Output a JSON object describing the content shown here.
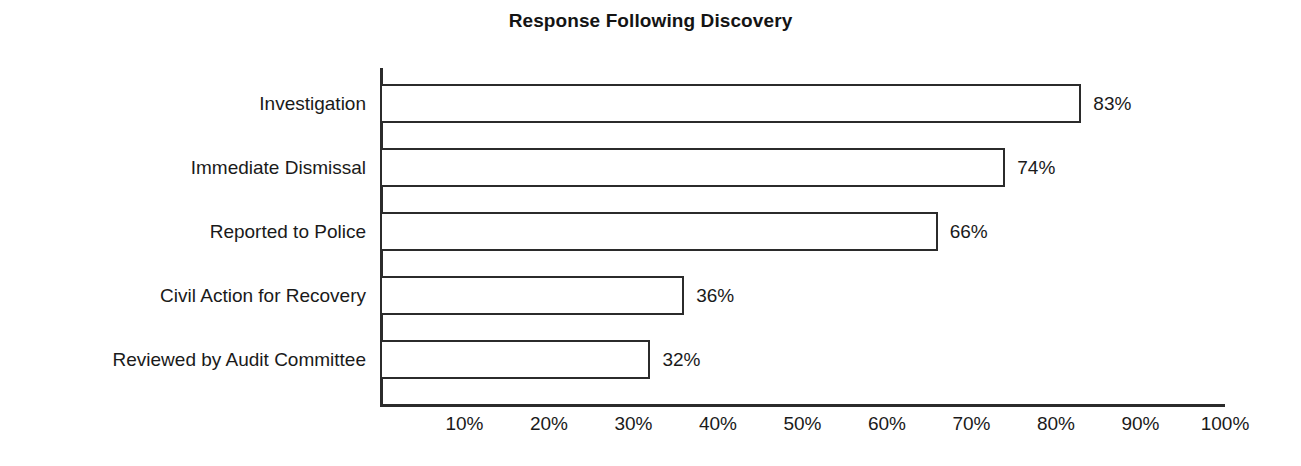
{
  "chart_data": {
    "type": "bar",
    "orientation": "horizontal",
    "title": "Response Following Discovery",
    "xlabel": "",
    "ylabel": "",
    "categories": [
      "Investigation",
      "Immediate Dismissal",
      "Reported to Police",
      "Civil Action for Recovery",
      "Reviewed by Audit Committee"
    ],
    "values": [
      83,
      74,
      66,
      36,
      32
    ],
    "value_labels": [
      "83%",
      "74%",
      "66%",
      "36%",
      "32%"
    ],
    "xlim": [
      0,
      100
    ],
    "xticks": [
      10,
      20,
      30,
      40,
      50,
      60,
      70,
      80,
      90,
      100
    ],
    "xtick_labels": [
      "10%",
      "20%",
      "30%",
      "40%",
      "50%",
      "60%",
      "70%",
      "80%",
      "90%",
      "100%"
    ],
    "grid": false,
    "legend": null,
    "bar_fill_color": "#ffffff",
    "bar_edge_color": "#2b2b2b",
    "axis_color": "#2b2b2b",
    "text_color": "#1a1a1a",
    "background_color": "#ffffff"
  }
}
